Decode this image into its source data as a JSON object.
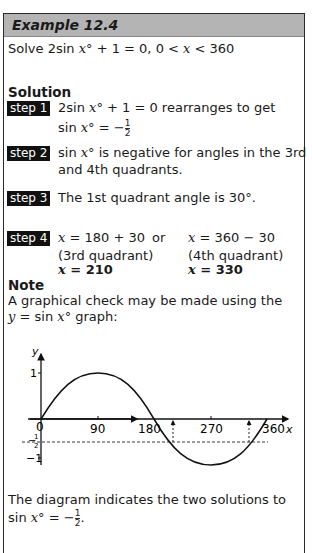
{
  "header": {
    "title": "Example 12.4"
  },
  "problem": {
    "prefix": "Solve 2sin ",
    "var": "x",
    "suffix": "° + 1 = 0, 0 < ",
    "var2": "x",
    "suffix2": " < 360"
  },
  "solution": {
    "heading": "Solution",
    "steps": [
      {
        "label": "step 1",
        "line1": "2sin x° + 1 = 0 rearranges to get",
        "line2_prefix": "sin x° = −",
        "frac_num": "1",
        "frac_den": "2"
      },
      {
        "label": "step 2",
        "line1": "sin x° is negative for angles in the 3rd",
        "line2": "and 4th quadrants."
      },
      {
        "label": "step 3",
        "line1": "The 1st quadrant angle is 30°."
      },
      {
        "label": "step 4",
        "col1": [
          "x = 180 + 30",
          "(3rd quadrant)",
          "x = 210"
        ],
        "or": "or",
        "col2": [
          "x = 360 − 30",
          "(4th quadrant)",
          "x = 330"
        ]
      }
    ]
  },
  "note": {
    "heading": "Note",
    "line1": "A graphical check may be made using the",
    "line2": "y = sin x° graph:",
    "conclusion1": "The diagram indicates the two solutions to",
    "conclusion2_prefix": "sin x° = −",
    "frac_num": "1",
    "frac_den": "2"
  },
  "graph": {
    "x_label": "x",
    "y_label": "y",
    "x_ticks": [
      "0",
      "90",
      "180",
      "270",
      "360"
    ],
    "y_ticks": [
      "1",
      "−1"
    ],
    "neg_half": {
      "num": "1",
      "den": "2"
    }
  }
}
